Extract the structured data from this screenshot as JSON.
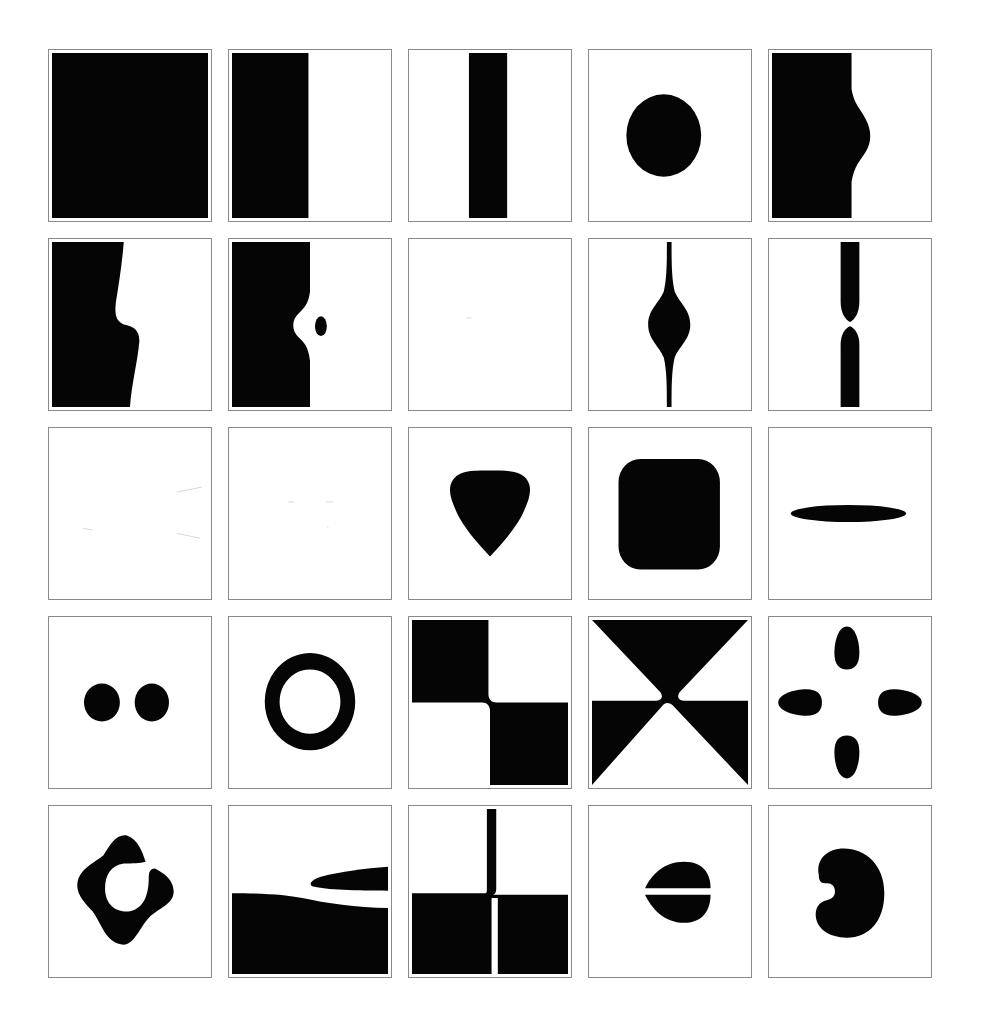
{
  "figure": {
    "layout": {
      "rows": 5,
      "columns": 5
    },
    "ink_color": "#050505",
    "background_color": "#ffffff",
    "border_color": "#8a8a8a",
    "panels": [
      {
        "index": 1,
        "row": 1,
        "col": 1,
        "shape": "full-black-square"
      },
      {
        "index": 2,
        "row": 1,
        "col": 2,
        "shape": "left-half-black"
      },
      {
        "index": 3,
        "row": 1,
        "col": 3,
        "shape": "vertical-bar"
      },
      {
        "index": 4,
        "row": 1,
        "col": 4,
        "shape": "circle"
      },
      {
        "index": 5,
        "row": 1,
        "col": 5,
        "shape": "left-block-with-bulge"
      },
      {
        "index": 6,
        "row": 2,
        "col": 1,
        "shape": "left-block-with-step"
      },
      {
        "index": 7,
        "row": 2,
        "col": 2,
        "shape": "left-block-with-notch-and-dot"
      },
      {
        "index": 8,
        "row": 2,
        "col": 3,
        "shape": "blank"
      },
      {
        "index": 9,
        "row": 2,
        "col": 4,
        "shape": "spindle"
      },
      {
        "index": 10,
        "row": 2,
        "col": 5,
        "shape": "pinched-bar"
      },
      {
        "index": 11,
        "row": 3,
        "col": 1,
        "shape": "faint-blank"
      },
      {
        "index": 12,
        "row": 3,
        "col": 2,
        "shape": "faint-blank"
      },
      {
        "index": 13,
        "row": 3,
        "col": 3,
        "shape": "rounded-triangle"
      },
      {
        "index": 14,
        "row": 3,
        "col": 4,
        "shape": "rounded-square"
      },
      {
        "index": 15,
        "row": 3,
        "col": 5,
        "shape": "horizontal-ellipse"
      },
      {
        "index": 16,
        "row": 4,
        "col": 1,
        "shape": "two-dots"
      },
      {
        "index": 17,
        "row": 4,
        "col": 2,
        "shape": "ring"
      },
      {
        "index": 18,
        "row": 4,
        "col": 3,
        "shape": "checker-diagonal"
      },
      {
        "index": 19,
        "row": 4,
        "col": 4,
        "shape": "hourglass-bowtie"
      },
      {
        "index": 20,
        "row": 4,
        "col": 5,
        "shape": "four-petals"
      },
      {
        "index": 21,
        "row": 5,
        "col": 1,
        "shape": "open-ring-blob"
      },
      {
        "index": 22,
        "row": 5,
        "col": 2,
        "shape": "bottom-block-with-wedge"
      },
      {
        "index": 23,
        "row": 5,
        "col": 3,
        "shape": "inverted-t-with-slit"
      },
      {
        "index": 24,
        "row": 5,
        "col": 4,
        "shape": "split-lens"
      },
      {
        "index": 25,
        "row": 5,
        "col": 5,
        "shape": "kidney-pacman"
      }
    ]
  }
}
